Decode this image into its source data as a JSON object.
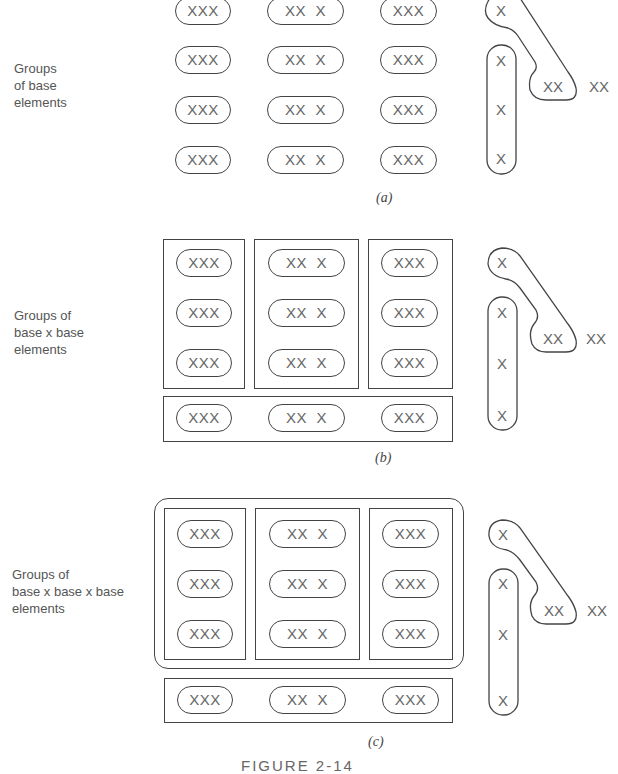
{
  "figure": {
    "caption": "FIGURE 2-14",
    "panels": [
      {
        "id": "a",
        "caption": "(a)",
        "label_lines": [
          "Groups",
          "of base",
          "elements"
        ],
        "rows": [
          [
            "XXX",
            "XX  X",
            "XXX"
          ],
          [
            "XXX",
            "XX  X",
            "XXX"
          ],
          [
            "XXX",
            "XX  X",
            "XXX"
          ],
          [
            "XXX",
            "XX  X",
            "XXX"
          ]
        ],
        "right": {
          "top": "X",
          "vertical": [
            "X",
            "X",
            "X"
          ],
          "pair": "XX",
          "trailing": "XX"
        }
      },
      {
        "id": "b",
        "caption": "(b)",
        "label_lines": [
          "Groups of",
          "base x base",
          "elements"
        ],
        "rows": [
          [
            "XXX",
            "XX  X",
            "XXX"
          ],
          [
            "XXX",
            "XX  X",
            "XXX"
          ],
          [
            "XXX",
            "XX  X",
            "XXX"
          ],
          [
            "XXX",
            "XX  X",
            "XXX"
          ]
        ],
        "right": {
          "top": "X",
          "vertical": [
            "X",
            "X",
            "X"
          ],
          "pair": "XX",
          "trailing": "XX"
        }
      },
      {
        "id": "c",
        "caption": "(c)",
        "label_lines": [
          "Groups of",
          "base x base x base",
          "elements"
        ],
        "rows": [
          [
            "XXX",
            "XX  X",
            "XXX"
          ],
          [
            "XXX",
            "XX  X",
            "XXX"
          ],
          [
            "XXX",
            "XX  X",
            "XXX"
          ],
          [
            "XXX",
            "XX  X",
            "XXX"
          ]
        ],
        "right": {
          "top": "X",
          "vertical": [
            "X",
            "X",
            "X"
          ],
          "pair": "XX",
          "trailing": "XX"
        }
      }
    ]
  }
}
